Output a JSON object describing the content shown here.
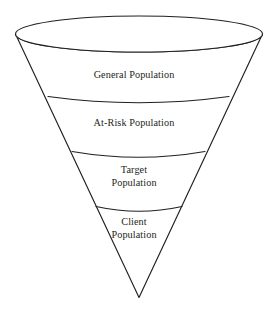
{
  "diagram": {
    "type": "inverted-cone-funnel",
    "background_color": "#ffffff",
    "stroke_color": "#231f20",
    "text_color": "#231f20",
    "segments": [
      {
        "id": "general",
        "label": "General Population",
        "order": 1
      },
      {
        "id": "at_risk",
        "label": "At-Risk Population",
        "order": 2
      },
      {
        "id": "target",
        "label": "Target\nPopulation",
        "order": 3
      },
      {
        "id": "client",
        "label": "Client\nPopulation",
        "order": 4
      }
    ]
  }
}
